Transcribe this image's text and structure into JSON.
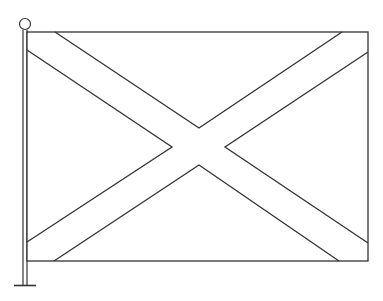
{
  "figure": {
    "colors": {
      "stroke": "#333333",
      "background": "#ffffff"
    }
  }
}
